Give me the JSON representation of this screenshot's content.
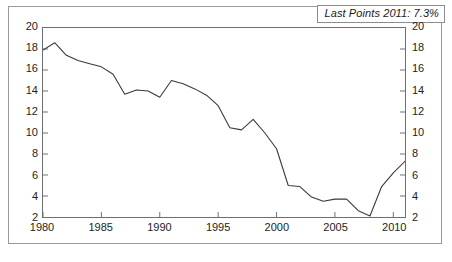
{
  "annotation": {
    "text": "Last Points 2011: 7.3%"
  },
  "axes": {
    "y_ticks": [
      20,
      18,
      16,
      14,
      12,
      10,
      8,
      6,
      4,
      2
    ],
    "x_ticks": [
      1980,
      1985,
      1990,
      1995,
      2000,
      2005,
      2010
    ],
    "y_min": 2,
    "y_max": 20,
    "x_min": 1980,
    "x_max": 2011
  },
  "caption_fragment": {
    "text": ""
  },
  "chart_data": {
    "type": "line",
    "title": "",
    "subtitle": "",
    "xlabel": "",
    "ylabel": "",
    "xlim": [
      1980,
      2011
    ],
    "ylim": [
      2,
      20
    ],
    "grid": false,
    "legend": null,
    "annotations": [
      {
        "text": "Last Points 2011: 7.3%",
        "position": "top-right"
      }
    ],
    "axis_ticks": {
      "x": [
        1980,
        1985,
        1990,
        1995,
        2000,
        2005,
        2010
      ],
      "y": [
        2,
        4,
        6,
        8,
        10,
        12,
        14,
        16,
        18,
        20
      ],
      "y_right": [
        2,
        4,
        6,
        8,
        10,
        12,
        14,
        16,
        18,
        20
      ]
    },
    "line_color": "#3a3a3a",
    "x": [
      1980,
      1981,
      1982,
      1983,
      1984,
      1985,
      1986,
      1987,
      1988,
      1989,
      1990,
      1991,
      1992,
      1993,
      1994,
      1995,
      1996,
      1997,
      1998,
      1999,
      2000,
      2001,
      2002,
      2003,
      2004,
      2005,
      2006,
      2007,
      2008,
      2009,
      2010,
      2011
    ],
    "values": [
      17.9,
      18.6,
      17.4,
      16.9,
      16.6,
      16.3,
      15.6,
      13.7,
      14.1,
      14.0,
      13.4,
      15.0,
      14.7,
      14.2,
      13.6,
      12.6,
      10.5,
      10.3,
      11.3,
      10.0,
      8.5,
      5.0,
      4.9,
      3.9,
      3.5,
      3.7,
      3.7,
      2.6,
      2.1,
      4.9,
      6.2,
      7.3
    ],
    "series": [
      {
        "name": "series-1",
        "values": [
          17.9,
          18.6,
          17.4,
          16.9,
          16.6,
          16.3,
          15.6,
          13.7,
          14.1,
          14.0,
          13.4,
          15.0,
          14.7,
          14.2,
          13.6,
          12.6,
          10.5,
          10.3,
          11.3,
          10.0,
          8.5,
          5.0,
          4.9,
          3.9,
          3.5,
          3.7,
          3.7,
          2.6,
          2.1,
          4.9,
          6.2,
          7.3
        ]
      }
    ],
    "last_point": {
      "x": 2011,
      "y": 7.3,
      "label": "Last Points 2011: 7.3%"
    }
  }
}
